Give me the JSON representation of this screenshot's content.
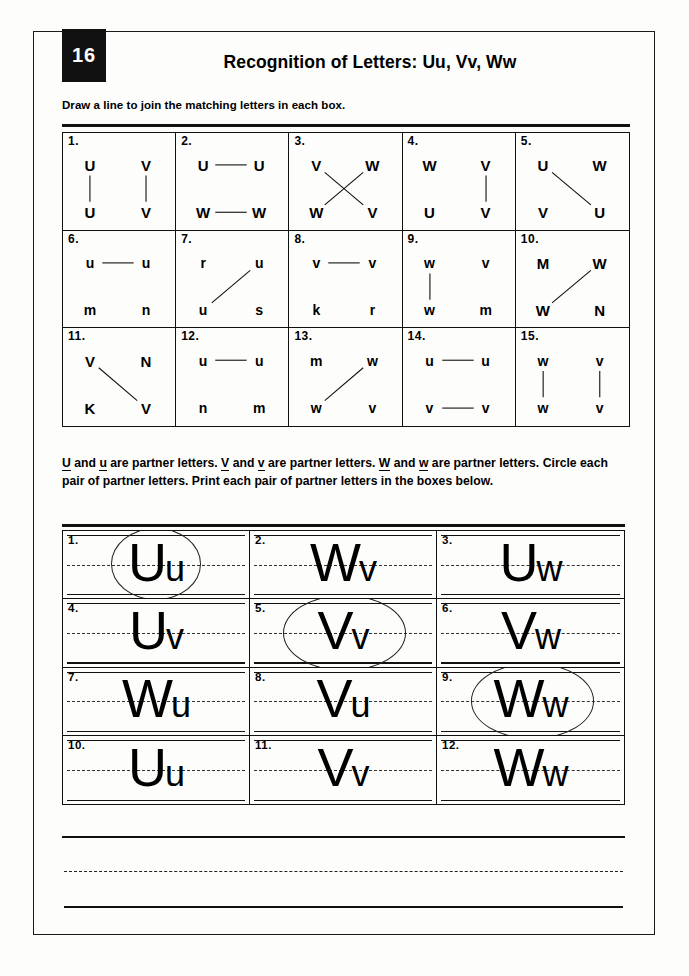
{
  "page": {
    "number": "16",
    "title": "Recognition of Letters: Uu, Vv, Ww"
  },
  "instructions": {
    "matching": "Draw a line to join the matching letters in each box.",
    "partner_line1_a": "U",
    "partner_line1_b": " and ",
    "partner_line1_c": "u",
    "partner_text": "U and u are partner letters. V and v are partner letters. W and w are partner letters. Circle each pair of partner letters. Print each pair of partner letters in the boxes below."
  },
  "matching_grid": {
    "boxes": [
      {
        "num": "1.",
        "tl": "U",
        "tr": "V",
        "bl": "U",
        "br": "V",
        "case": "upper",
        "lines": [
          {
            "from": "tl",
            "to": "bl"
          },
          {
            "from": "tr",
            "to": "br"
          }
        ]
      },
      {
        "num": "2.",
        "tl": "U",
        "tr": "U",
        "bl": "W",
        "br": "W",
        "case": "upper",
        "lines": [
          {
            "from": "tl",
            "to": "tr"
          },
          {
            "from": "bl",
            "to": "br"
          }
        ]
      },
      {
        "num": "3.",
        "tl": "V",
        "tr": "W",
        "bl": "W",
        "br": "V",
        "case": "upper",
        "lines": [
          {
            "from": "tl",
            "to": "br"
          },
          {
            "from": "tr",
            "to": "bl"
          }
        ]
      },
      {
        "num": "4.",
        "tl": "W",
        "tr": "V",
        "bl": "U",
        "br": "V",
        "case": "upper",
        "lines": [
          {
            "from": "tr",
            "to": "br"
          }
        ]
      },
      {
        "num": "5.",
        "tl": "U",
        "tr": "W",
        "bl": "V",
        "br": "U",
        "case": "upper",
        "lines": [
          {
            "from": "tl",
            "to": "br"
          }
        ]
      },
      {
        "num": "6.",
        "tl": "u",
        "tr": "u",
        "bl": "m",
        "br": "n",
        "case": "lower",
        "lines": [
          {
            "from": "tl",
            "to": "tr"
          }
        ]
      },
      {
        "num": "7.",
        "tl": "r",
        "tr": "u",
        "bl": "u",
        "br": "s",
        "case": "lower",
        "lines": [
          {
            "from": "tr",
            "to": "bl"
          }
        ]
      },
      {
        "num": "8.",
        "tl": "v",
        "tr": "v",
        "bl": "k",
        "br": "r",
        "case": "lower",
        "lines": [
          {
            "from": "tl",
            "to": "tr"
          }
        ]
      },
      {
        "num": "9.",
        "tl": "w",
        "tr": "v",
        "bl": "w",
        "br": "m",
        "case": "lower",
        "lines": [
          {
            "from": "tl",
            "to": "bl"
          }
        ]
      },
      {
        "num": "10.",
        "tl": "M",
        "tr": "W",
        "bl": "W",
        "br": "N",
        "case": "upper",
        "lines": [
          {
            "from": "tr",
            "to": "bl"
          }
        ]
      },
      {
        "num": "11.",
        "tl": "V",
        "tr": "N",
        "bl": "K",
        "br": "V",
        "case": "upper",
        "lines": [
          {
            "from": "tl",
            "to": "br"
          }
        ]
      },
      {
        "num": "12.",
        "tl": "u",
        "tr": "u",
        "bl": "n",
        "br": "m",
        "case": "lower",
        "lines": [
          {
            "from": "tl",
            "to": "tr"
          }
        ]
      },
      {
        "num": "13.",
        "tl": "m",
        "tr": "w",
        "bl": "w",
        "br": "v",
        "case": "lower",
        "lines": [
          {
            "from": "tr",
            "to": "bl"
          }
        ]
      },
      {
        "num": "14.",
        "tl": "u",
        "tr": "u",
        "bl": "v",
        "br": "v",
        "case": "lower",
        "lines": [
          {
            "from": "tl",
            "to": "tr"
          },
          {
            "from": "bl",
            "to": "br"
          }
        ]
      },
      {
        "num": "15.",
        "tl": "w",
        "tr": "v",
        "bl": "w",
        "br": "v",
        "case": "lower",
        "lines": [
          {
            "from": "tl",
            "to": "bl"
          },
          {
            "from": "tr",
            "to": "br"
          }
        ]
      }
    ]
  },
  "writing_grid": {
    "boxes": [
      {
        "num": "1.",
        "cap": "U",
        "low": "u",
        "circled": true,
        "circle_shape": "round"
      },
      {
        "num": "2.",
        "cap": "W",
        "low": "v",
        "circled": false,
        "circle_shape": ""
      },
      {
        "num": "3.",
        "cap": "U",
        "low": "w",
        "circled": false,
        "circle_shape": ""
      },
      {
        "num": "4.",
        "cap": "U",
        "low": "v",
        "circled": false,
        "circle_shape": ""
      },
      {
        "num": "5.",
        "cap": "V",
        "low": "v",
        "circled": true,
        "circle_shape": "wide"
      },
      {
        "num": "6.",
        "cap": "V",
        "low": "w",
        "circled": false,
        "circle_shape": ""
      },
      {
        "num": "7.",
        "cap": "W",
        "low": "u",
        "circled": false,
        "circle_shape": ""
      },
      {
        "num": "8.",
        "cap": "V",
        "low": "u",
        "circled": false,
        "circle_shape": ""
      },
      {
        "num": "9.",
        "cap": "W",
        "low": "w",
        "circled": true,
        "circle_shape": "wide"
      },
      {
        "num": "10.",
        "cap": "U",
        "low": "u",
        "circled": false,
        "circle_shape": ""
      },
      {
        "num": "11.",
        "cap": "V",
        "low": "v",
        "circled": false,
        "circle_shape": ""
      },
      {
        "num": "12.",
        "cap": "W",
        "low": "w",
        "circled": false,
        "circle_shape": ""
      }
    ]
  },
  "colors": {
    "ink": "#111111",
    "paper": "#fdfdfb",
    "tab_bg": "#111111",
    "tab_text": "#ffffff"
  }
}
